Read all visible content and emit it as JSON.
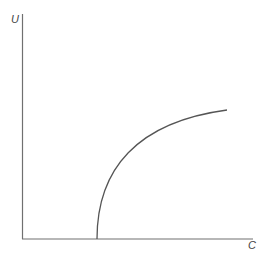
{
  "chart_data": {
    "type": "line",
    "title": "",
    "xlabel": "C",
    "ylabel": "U",
    "grid": false,
    "legend": null,
    "ticks": {
      "x": [],
      "y": []
    },
    "series": [
      {
        "name": "U(C)",
        "description": "Zero until a threshold C, then rises steeply (vertical tangent) and flattens — concave, square-root-like shape",
        "x": [
          0,
          0.3,
          0.3,
          0.35,
          0.4,
          0.5,
          0.6,
          0.7,
          0.8,
          0.88
        ],
        "y": [
          0,
          0,
          0,
          0.28,
          0.38,
          0.51,
          0.6,
          0.67,
          0.73,
          0.77
        ]
      }
    ],
    "xlim": [
      0,
      1
    ],
    "ylim": [
      0,
      1
    ]
  },
  "colors": {
    "axis": "#707070",
    "curve": "#555555",
    "label": "#444444",
    "background": "#ffffff"
  }
}
